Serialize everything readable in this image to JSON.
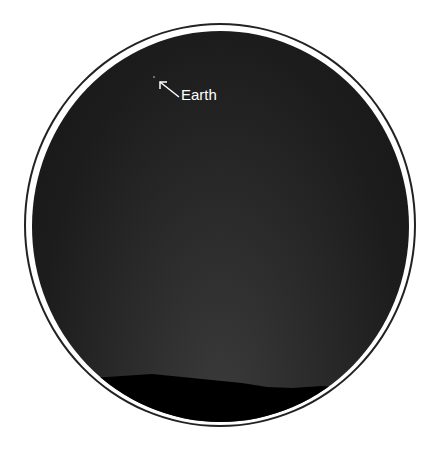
{
  "image": {
    "subject": "Night sky seen through a circular frame with horizon silhouette",
    "annotation": {
      "label": "Earth",
      "arrow_direction": "up-left"
    },
    "colors": {
      "sky": "#1c1c1c",
      "horizon": "#000000",
      "frame_stroke": "#222222",
      "label": "#ffffff"
    }
  }
}
